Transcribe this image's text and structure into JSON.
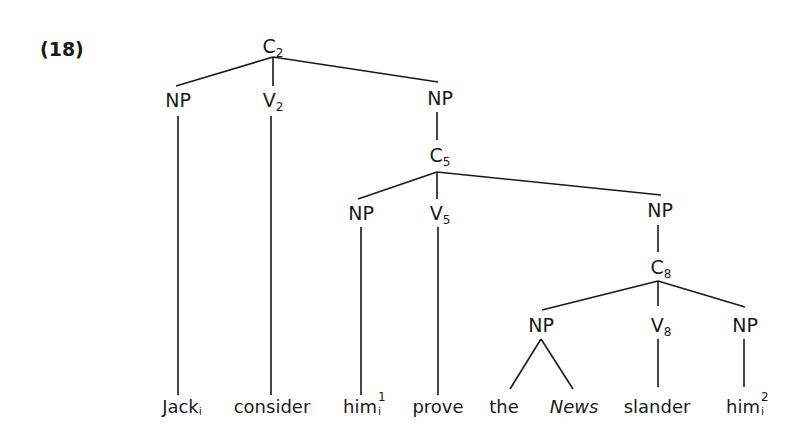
{
  "example_number": "(18)",
  "nodes": {
    "c2": {
      "cat": "C",
      "idx": "2"
    },
    "np1": {
      "cat": "NP"
    },
    "v2": {
      "cat": "V",
      "idx": "2"
    },
    "np2": {
      "cat": "NP"
    },
    "c5": {
      "cat": "C",
      "idx": "5"
    },
    "np3": {
      "cat": "NP"
    },
    "v5": {
      "cat": "V",
      "idx": "5"
    },
    "np4": {
      "cat": "NP"
    },
    "c8": {
      "cat": "C",
      "idx": "8"
    },
    "np5": {
      "cat": "NP"
    },
    "v8": {
      "cat": "V",
      "idx": "8"
    },
    "np6": {
      "cat": "NP"
    }
  },
  "words": {
    "jack": {
      "text": "Jack",
      "sub": "i"
    },
    "consider": {
      "text": "consider"
    },
    "him1": {
      "text": "him",
      "sup": "1",
      "sub": "i"
    },
    "prove": {
      "text": "prove"
    },
    "the": {
      "text": "the"
    },
    "news": {
      "text": "News"
    },
    "slander": {
      "text": "slander"
    },
    "him2": {
      "text": "him",
      "sup": "2",
      "sub": "i"
    }
  }
}
